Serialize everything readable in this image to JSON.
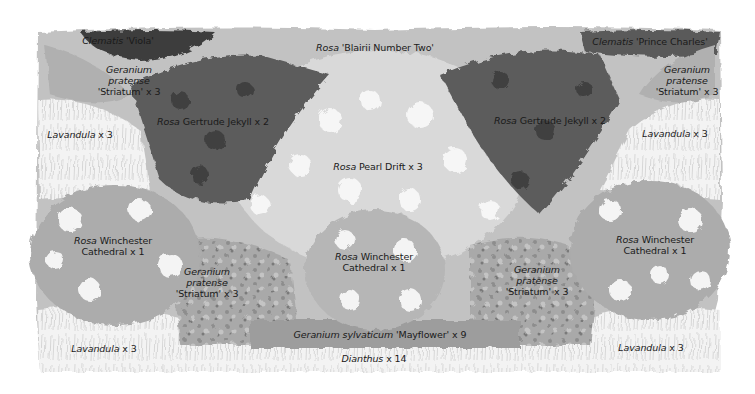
{
  "plan": {
    "title": "Planting plan",
    "colors": {
      "background": "#ffffff",
      "bed_base": "#b9b9b9",
      "dark_foliage": "#4a4a4a",
      "mid_foliage": "#8c8c8c",
      "light_blooms": "#f2f2f2",
      "lavender_grass": "#e6e6e6",
      "text": "#1a1a1a"
    },
    "labels": [
      {
        "id": "clematis-viola",
        "genus": "Clematis",
        "rest": " 'Viola'",
        "lines": [],
        "x": 118,
        "y": 40
      },
      {
        "id": "rosa-blairii",
        "genus": "Rosa",
        "rest": " 'Blairii Number Two'",
        "lines": [],
        "x": 375,
        "y": 47
      },
      {
        "id": "clematis-prince-charles",
        "genus": "Clematis",
        "rest": " 'Prince Charles'",
        "lines": [],
        "x": 650,
        "y": 41
      },
      {
        "id": "geranium-striatum-tl",
        "genus": "Geranium",
        "rest": "",
        "lines": [
          "pratense",
          "'Striatum' x 3"
        ],
        "italic_lines": [
          true,
          false
        ],
        "x": 129,
        "y": 80
      },
      {
        "id": "geranium-striatum-tr",
        "genus": "Geranium",
        "rest": "",
        "lines": [
          "pratense",
          "'Striatum' x 3"
        ],
        "italic_lines": [
          true,
          false
        ],
        "x": 687,
        "y": 80
      },
      {
        "id": "lavandula-tl",
        "genus": "Lavandula",
        "rest": " x 3",
        "lines": [],
        "x": 80,
        "y": 134
      },
      {
        "id": "lavandula-tr",
        "genus": "Lavandula",
        "rest": " x 3",
        "lines": [],
        "x": 675,
        "y": 133
      },
      {
        "id": "rosa-gertrude-left",
        "genus": "Rosa",
        "rest": " Gertrude Jekyll x 2",
        "lines": [],
        "x": 213,
        "y": 121
      },
      {
        "id": "rosa-gertrude-right",
        "genus": "Rosa",
        "rest": " Gertrude Jekyll x 2",
        "lines": [],
        "x": 550,
        "y": 120
      },
      {
        "id": "rosa-pearl-drift",
        "genus": "Rosa",
        "rest": " Pearl Drift x 3",
        "lines": [],
        "x": 378,
        "y": 166
      },
      {
        "id": "rosa-winchester-left",
        "genus": "Rosa",
        "rest": " Winchester",
        "lines": [
          "Cathedral x 1"
        ],
        "italic_lines": [
          false
        ],
        "x": 113,
        "y": 246
      },
      {
        "id": "rosa-winchester-center",
        "genus": "Rosa",
        "rest": " Winchester",
        "lines": [
          "Cathedral x 1"
        ],
        "italic_lines": [
          false
        ],
        "x": 374,
        "y": 262
      },
      {
        "id": "rosa-winchester-right",
        "genus": "Rosa",
        "rest": " Winchester",
        "lines": [
          "Cathedral x 1"
        ],
        "italic_lines": [
          false
        ],
        "x": 655,
        "y": 245
      },
      {
        "id": "geranium-striatum-bl",
        "genus": "Geranium",
        "rest": "",
        "lines": [
          "pratense",
          "'Striatum' x 3"
        ],
        "italic_lines": [
          true,
          false
        ],
        "x": 207,
        "y": 282
      },
      {
        "id": "geranium-striatum-br",
        "genus": "Geranium",
        "rest": "",
        "lines": [
          "pratense",
          "'Striatum' x 3"
        ],
        "italic_lines": [
          true,
          false
        ],
        "x": 537,
        "y": 280
      },
      {
        "id": "geranium-mayflower",
        "genus": "Geranium sylvaticum",
        "rest": " 'Mayflower' x 9",
        "lines": [],
        "x": 380,
        "y": 334
      },
      {
        "id": "dianthus",
        "genus": "Dianthus",
        "rest": " x 14",
        "lines": [],
        "x": 374,
        "y": 358
      },
      {
        "id": "lavandula-bl",
        "genus": "Lavandula",
        "rest": " x 3",
        "lines": [],
        "x": 104,
        "y": 348
      },
      {
        "id": "lavandula-br",
        "genus": "Lavandula",
        "rest": " x 3",
        "lines": [],
        "x": 651,
        "y": 347
      }
    ]
  }
}
